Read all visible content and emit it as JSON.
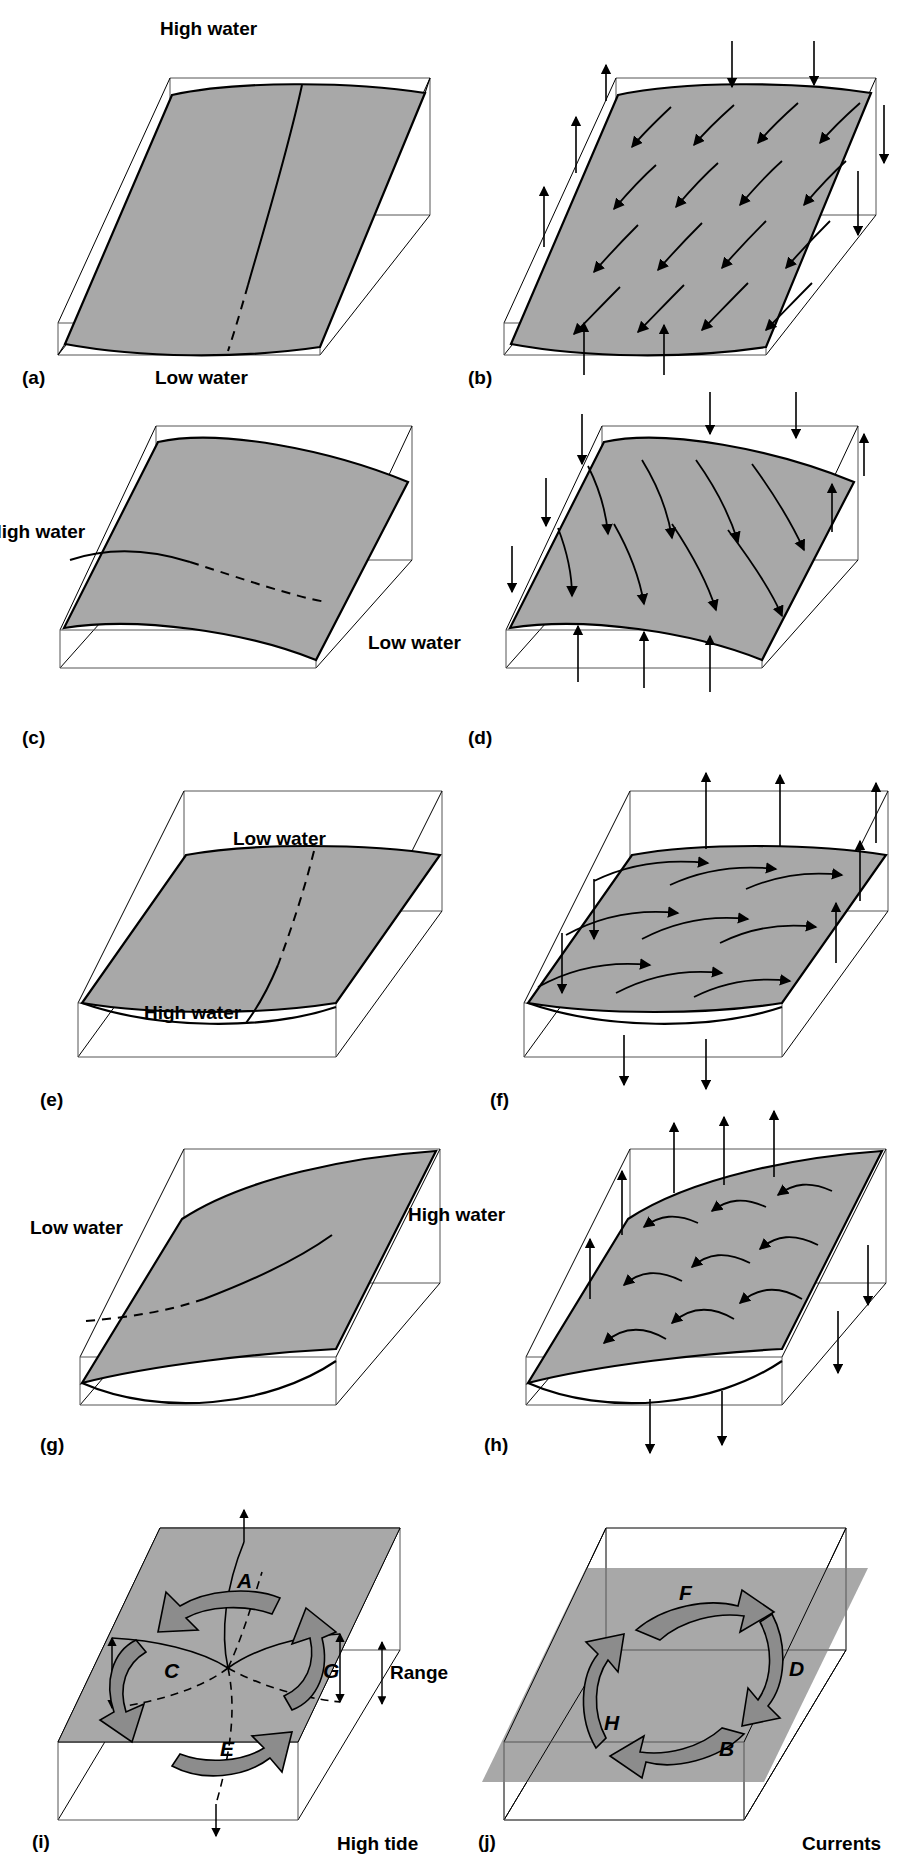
{
  "figure": {
    "kind": "tidal-basin-amphidromic-diagram",
    "panel_count": 10,
    "columns": 2,
    "rows": 5,
    "background_color": "#ffffff",
    "line_color": "#000000",
    "water_surface_fill": "#a8a8a8",
    "arrow_band_fill": "#8c8c8c"
  },
  "labels": {
    "high_water": "High water",
    "low_water": "Low water",
    "range": "Range",
    "high_tide": "High tide",
    "currents": "Currents"
  },
  "panels": [
    {
      "id": "a",
      "tag": "(a)",
      "column": "left",
      "type": "water-surface",
      "annotations": [
        {
          "text": "High water",
          "position": "top-center"
        },
        {
          "text": "Low water",
          "position": "bottom-center"
        }
      ]
    },
    {
      "id": "b",
      "tag": "(b)",
      "column": "right",
      "type": "currents",
      "annotations": []
    },
    {
      "id": "c",
      "tag": "(c)",
      "column": "left",
      "type": "water-surface",
      "annotations": [
        {
          "text": "High water",
          "position": "mid-left"
        },
        {
          "text": "Low water",
          "position": "mid-right"
        }
      ]
    },
    {
      "id": "d",
      "tag": "(d)",
      "column": "right",
      "type": "currents",
      "annotations": []
    },
    {
      "id": "e",
      "tag": "(e)",
      "column": "left",
      "type": "water-surface",
      "annotations": [
        {
          "text": "Low water",
          "position": "top-center"
        },
        {
          "text": "High water",
          "position": "bottom-center"
        }
      ]
    },
    {
      "id": "f",
      "tag": "(f)",
      "column": "right",
      "type": "currents",
      "annotations": []
    },
    {
      "id": "g",
      "tag": "(g)",
      "column": "left",
      "type": "water-surface",
      "annotations": [
        {
          "text": "Low water",
          "position": "mid-left"
        },
        {
          "text": "High water",
          "position": "mid-right"
        }
      ]
    },
    {
      "id": "h",
      "tag": "(h)",
      "column": "right",
      "type": "currents",
      "annotations": []
    },
    {
      "id": "i",
      "tag": "(i)",
      "column": "left",
      "type": "amphidromic-summary",
      "annotations": [
        {
          "text": "Range",
          "position": "mid-right"
        },
        {
          "text": "High tide",
          "position": "bottom-right"
        }
      ],
      "phase_labels": [
        "A",
        "C",
        "E",
        "G"
      ]
    },
    {
      "id": "j",
      "tag": "(j)",
      "column": "right",
      "type": "current-summary",
      "annotations": [
        {
          "text": "Currents",
          "position": "bottom-right"
        }
      ],
      "phase_labels": [
        "F",
        "D",
        "H",
        "B"
      ]
    }
  ]
}
